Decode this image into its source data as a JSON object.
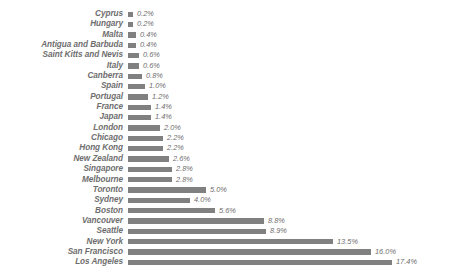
{
  "chart_data": {
    "type": "bar",
    "orientation": "horizontal",
    "title": "",
    "subtitle": "",
    "xlabel": "",
    "ylabel": "",
    "grid": false,
    "legend": false,
    "axis_visible": false,
    "value_suffix": "%",
    "xlim": [
      0,
      17.4
    ],
    "colors": {
      "bar": "#808080",
      "label_text": "#6e6e6e",
      "value_text": "#6e6e6e",
      "background": "#ffffff"
    },
    "categories": [
      "Cyprus",
      "Hungary",
      "Malta",
      "Antigua and Barbuda",
      "Saint Kitts and Nevis",
      "Italy",
      "Canberra",
      "Spain",
      "Portugal",
      "France",
      "Japan",
      "London",
      "Chicago",
      "Hong Kong",
      "New Zealand",
      "Singapore",
      "Melbourne",
      "Toronto",
      "Sydney",
      "Boston",
      "Vancouver",
      "Seattle",
      "New York",
      "San Francisco",
      "Los Angeles"
    ],
    "values": [
      0.2,
      0.2,
      0.4,
      0.4,
      0.6,
      0.6,
      0.8,
      1.0,
      1.2,
      1.4,
      1.4,
      2.0,
      2.2,
      2.2,
      2.6,
      2.8,
      2.8,
      5.0,
      4.0,
      5.6,
      8.8,
      8.9,
      13.5,
      16.0,
      17.4
    ],
    "value_labels": [
      "0.2%",
      "0.2%",
      "0.4%",
      "0.4%",
      "0.6%",
      "0.6%",
      "0.8%",
      "1.0%",
      "1.2%",
      "1.4%",
      "1.4%",
      "2.0%",
      "2.2%",
      "2.2%",
      "2.6%",
      "2.8%",
      "2.8%",
      "5.0%",
      "4.0%",
      "5.6%",
      "8.8%",
      "8.9%",
      "13.5%",
      "16.0%",
      "17.4%"
    ],
    "bar_pixel_lengths": [
      5,
      5,
      8,
      8,
      11,
      11,
      14,
      17,
      20,
      23,
      23,
      32,
      35,
      35,
      41,
      44,
      44,
      78,
      62,
      87,
      136,
      138,
      205,
      243,
      264
    ]
  }
}
